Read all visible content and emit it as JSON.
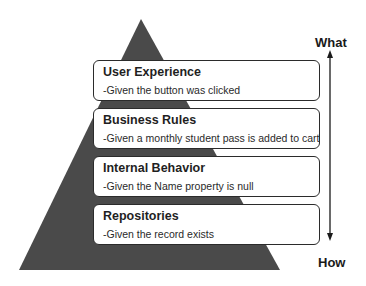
{
  "diagram": {
    "type": "pyramid",
    "colors": {
      "pyramid_fill": "#4a4a4a",
      "box_fill": "#ffffff",
      "box_border": "#2b2b2b",
      "text": "#1f1f1f"
    },
    "layers": [
      {
        "title": "User Experience",
        "description": "-Given the button was clicked"
      },
      {
        "title": "Business Rules",
        "description": "-Given a monthly student pass is added to cart"
      },
      {
        "title": "Internal Behavior",
        "description": "-Given the Name property is null"
      },
      {
        "title": "Repositories",
        "description": "-Given the record exists"
      }
    ],
    "axis": {
      "top_label": "What",
      "bottom_label": "How",
      "direction": "bidirectional-vertical"
    }
  }
}
